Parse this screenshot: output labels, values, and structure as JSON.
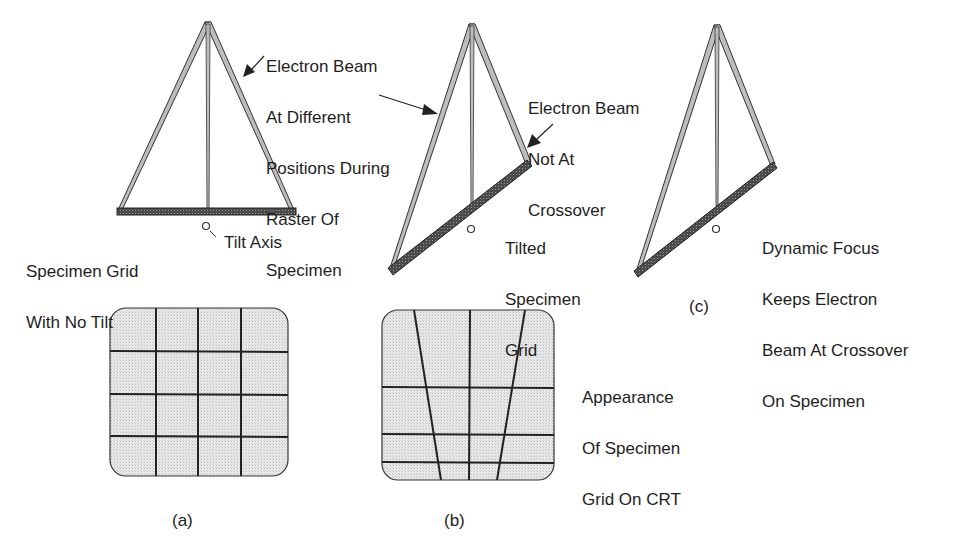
{
  "panels": {
    "a": {
      "caption": "(a)",
      "grid_label": [
        "Specimen Grid",
        "With No Tilt"
      ],
      "tilt_axis_label": "Tilt Axis",
      "beam_label": [
        "Electron Beam",
        "At Different",
        "Positions During",
        "Raster Of",
        "Specimen"
      ]
    },
    "b": {
      "caption": "(b)",
      "beam_label": [
        "Electron Beam",
        "Not At",
        "Crossover"
      ],
      "grid_label": [
        "Tilted",
        "Specimen",
        "Grid"
      ]
    },
    "c": {
      "caption": "(c)",
      "focus_label": [
        "Dynamic Focus",
        "Keeps Electron",
        "Beam At Crossover",
        "On Specimen"
      ]
    }
  },
  "crt_label": [
    "Appearance",
    "Of Specimen",
    "Grid On CRT"
  ],
  "colors": {
    "ink": "#1e1e1e",
    "screen_fill": "#e4e4e4",
    "beam_fill": "#bdbdbd"
  }
}
